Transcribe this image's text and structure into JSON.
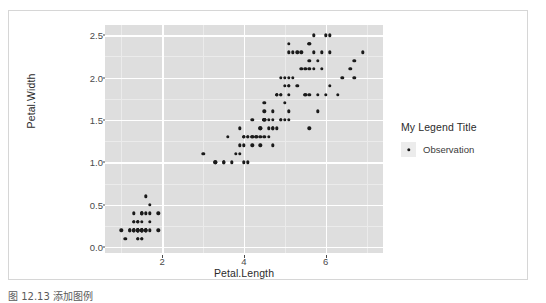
{
  "chart_data": {
    "type": "scatter",
    "title": "",
    "xlabel": "Petal.Length",
    "ylabel": "Petal.Width",
    "xlim": [
      0.6,
      7.4
    ],
    "ylim": [
      -0.07,
      2.62
    ],
    "xticks": [
      2,
      4,
      6
    ],
    "xtick_labels": [
      "2",
      "4",
      "6"
    ],
    "yticks": [
      0.0,
      0.5,
      1.0,
      1.5,
      2.0,
      2.5
    ],
    "ytick_labels": [
      "0.0",
      "0.5",
      "1.0",
      "1.5",
      "2.0",
      "2.5"
    ],
    "x_minor_ticks": [
      1,
      3,
      5,
      7
    ],
    "y_minor_ticks": [
      0.25,
      0.75,
      1.25,
      1.75,
      2.25
    ],
    "grid": true,
    "panel_background": "#dedede",
    "grid_major_color": "#ffffff",
    "grid_minor_color": "#ebebeb",
    "point_color": "#1a1a1a",
    "point_size": 3.4,
    "legend": {
      "position": "right",
      "title": "My Legend Title",
      "entries": [
        {
          "label": "Observation",
          "marker": "point",
          "color": "#1a1a1a"
        }
      ]
    },
    "series": [
      {
        "name": "Observation",
        "x": [
          1.4,
          1.4,
          1.3,
          1.5,
          1.4,
          1.7,
          1.4,
          1.5,
          1.4,
          1.5,
          1.5,
          1.6,
          1.4,
          1.1,
          1.2,
          1.5,
          1.3,
          1.4,
          1.7,
          1.5,
          1.7,
          1.5,
          1.0,
          1.7,
          1.9,
          1.6,
          1.6,
          1.5,
          1.4,
          1.6,
          1.6,
          1.5,
          1.5,
          1.4,
          1.5,
          1.2,
          1.3,
          1.4,
          1.3,
          1.5,
          1.3,
          1.3,
          1.3,
          1.6,
          1.9,
          1.4,
          1.6,
          1.4,
          1.5,
          1.4,
          4.7,
          4.5,
          4.9,
          4.0,
          4.6,
          4.5,
          4.7,
          3.3,
          4.6,
          3.9,
          3.5,
          4.2,
          4.0,
          4.7,
          3.6,
          4.4,
          4.5,
          4.1,
          4.5,
          3.9,
          4.8,
          4.0,
          4.9,
          4.7,
          4.3,
          4.4,
          4.8,
          5.0,
          4.5,
          3.5,
          3.8,
          3.7,
          3.9,
          5.1,
          4.5,
          4.5,
          4.7,
          4.4,
          4.1,
          4.0,
          4.4,
          4.6,
          4.0,
          3.3,
          4.2,
          4.2,
          4.2,
          4.3,
          3.0,
          4.1,
          6.0,
          5.1,
          5.9,
          5.6,
          5.8,
          6.6,
          4.5,
          6.3,
          5.8,
          6.1,
          5.1,
          5.3,
          5.5,
          5.0,
          5.1,
          5.3,
          5.5,
          6.7,
          6.9,
          5.0,
          5.7,
          4.9,
          6.7,
          4.9,
          5.7,
          6.0,
          4.8,
          4.9,
          5.6,
          5.8,
          6.1,
          6.4,
          5.6,
          5.1,
          5.6,
          6.1,
          5.6,
          5.5,
          4.8,
          5.4,
          5.6,
          5.1,
          5.1,
          5.9,
          5.7,
          5.2,
          5.0,
          5.2,
          5.4,
          5.1
        ],
        "y": [
          0.2,
          0.2,
          0.2,
          0.2,
          0.2,
          0.4,
          0.3,
          0.2,
          0.2,
          0.1,
          0.2,
          0.2,
          0.1,
          0.1,
          0.2,
          0.4,
          0.4,
          0.3,
          0.3,
          0.3,
          0.2,
          0.4,
          0.2,
          0.5,
          0.2,
          0.2,
          0.4,
          0.2,
          0.2,
          0.2,
          0.2,
          0.4,
          0.1,
          0.2,
          0.2,
          0.2,
          0.2,
          0.1,
          0.2,
          0.2,
          0.3,
          0.3,
          0.2,
          0.6,
          0.4,
          0.3,
          0.2,
          0.2,
          0.2,
          0.2,
          1.4,
          1.5,
          1.5,
          1.3,
          1.5,
          1.3,
          1.6,
          1.0,
          1.3,
          1.4,
          1.0,
          1.5,
          1.0,
          1.4,
          1.3,
          1.4,
          1.5,
          1.0,
          1.5,
          1.1,
          1.8,
          1.3,
          1.5,
          1.2,
          1.3,
          1.4,
          1.4,
          1.7,
          1.5,
          1.0,
          1.1,
          1.0,
          1.2,
          1.6,
          1.5,
          1.6,
          1.5,
          1.3,
          1.3,
          1.3,
          1.2,
          1.4,
          1.2,
          1.0,
          1.3,
          1.2,
          1.3,
          1.3,
          1.1,
          1.3,
          2.5,
          1.9,
          2.1,
          1.8,
          2.2,
          2.1,
          1.7,
          1.8,
          1.8,
          2.5,
          2.0,
          1.9,
          2.1,
          2.0,
          2.4,
          2.3,
          1.8,
          2.2,
          2.3,
          1.5,
          2.3,
          2.0,
          2.0,
          1.8,
          2.1,
          1.8,
          1.8,
          1.8,
          2.1,
          1.6,
          1.9,
          2.0,
          2.2,
          1.5,
          1.4,
          2.3,
          2.4,
          1.8,
          1.8,
          2.1,
          2.4,
          2.3,
          1.9,
          2.3,
          2.5,
          2.3,
          1.9,
          2.0,
          2.3,
          1.8
        ]
      }
    ]
  },
  "axes": {
    "x_title": "Petal.Length",
    "y_title": "Petal.Width"
  },
  "legend": {
    "title": "My Legend Title",
    "entry_label": "Observation"
  },
  "caption": {
    "text": "图 12.13  添加图例"
  }
}
